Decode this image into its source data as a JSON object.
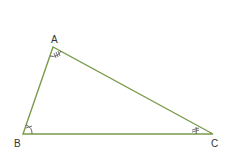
{
  "diagram": {
    "type": "triangle",
    "line_color": "#7a9a4a",
    "mark_color": "#555555",
    "vertices": [
      {
        "label": "A",
        "x": 53,
        "y": 47,
        "angle_mark": "triple-tick arc"
      },
      {
        "label": "B",
        "x": 23,
        "y": 134,
        "angle_mark": "single-tick arc"
      },
      {
        "label": "C",
        "x": 213,
        "y": 134,
        "angle_mark": "double-tick arc"
      }
    ]
  }
}
